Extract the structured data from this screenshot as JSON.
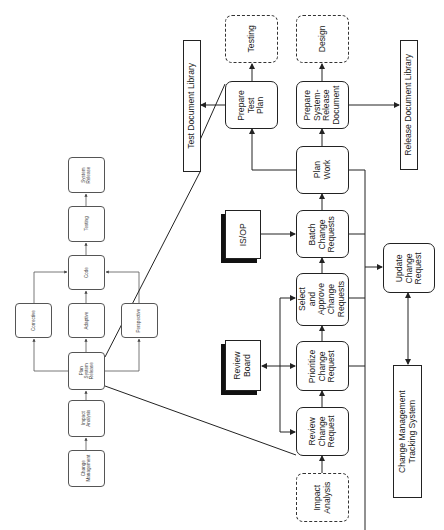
{
  "diagram": {
    "overview": {
      "boxes": {
        "change_management": "Change\nManagement",
        "impact_analysis": "Impact\nAnalysis",
        "plan_system_release": "Plan\nSystem\nRelease",
        "corrective": "Corrective",
        "adaptive": "Adaptive",
        "perspective": "Perspective",
        "code": "Code",
        "testing": "Testing",
        "system_release": "System\nRelease"
      }
    },
    "detail": {
      "boxes": {
        "test_document_library": "Test Document Library",
        "testing": "Testing",
        "prepare_test_plan": "Prepare\nTest\nPlan",
        "design": "Design",
        "prepare_system_release_document": "Prepare\nSystem-\nRelease\nDocument",
        "release_document_library": "Release Document Library",
        "plan_work": "Plan\nWork",
        "isop": "IS/OP",
        "batch_change_requests": "Batch\nChange\nRequests",
        "update_change_request": "Update\nChange\nRequest",
        "select_and_approve": "Select\nand\nApprove\nChange\nRequests",
        "review_board": "Review\nBoard",
        "prioritize_change_request": "Prioritize\nChange\nRequest",
        "review_change_request": "Review\nChange\nRequest",
        "impact_analysis": "Impact\nAnalysis",
        "change_management_tracking_system": "Change Management\nTracking System"
      }
    },
    "colors": {
      "line": "#222222",
      "background": "#ffffff",
      "shadow": "#111111"
    }
  }
}
